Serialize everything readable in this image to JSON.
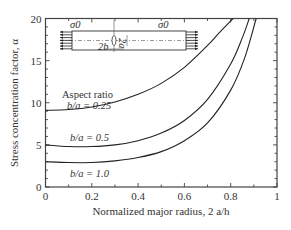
{
  "chart_data": {
    "type": "line",
    "title": "",
    "xlabel": "Normalized major radius, 2 a/h",
    "ylabel": "Stress concentration factor, α",
    "xlim": [
      0,
      1
    ],
    "ylim": [
      0,
      20
    ],
    "xticks": [
      "0",
      "0.2",
      "0.4",
      "0.6",
      "0.8",
      "1"
    ],
    "yticks": [
      "0",
      "5",
      "10",
      "15",
      "20"
    ],
    "grid": false,
    "legend": "inline annotations",
    "series": [
      {
        "name": "b/a = 0.25",
        "label_text": "b/a = 0.25",
        "x": [
          0,
          0.1,
          0.2,
          0.3,
          0.4,
          0.5,
          0.6,
          0.7,
          0.75,
          0.81
        ],
        "y": [
          9.1,
          9.2,
          9.5,
          10.1,
          11.0,
          12.3,
          14.2,
          16.8,
          18.3,
          20.0
        ]
      },
      {
        "name": "b/a = 0.5",
        "label_text": "b/a = 0.5",
        "x": [
          0,
          0.1,
          0.2,
          0.3,
          0.4,
          0.5,
          0.6,
          0.7,
          0.8,
          0.85,
          0.88
        ],
        "y": [
          5.0,
          4.8,
          4.8,
          5.0,
          5.5,
          6.4,
          7.9,
          10.4,
          14.6,
          17.7,
          20.0
        ]
      },
      {
        "name": "b/a = 1.0",
        "label_text": "b/a = 1.0",
        "x": [
          0,
          0.1,
          0.2,
          0.3,
          0.4,
          0.5,
          0.6,
          0.7,
          0.8,
          0.86,
          0.91
        ],
        "y": [
          3.0,
          2.9,
          2.9,
          3.1,
          3.5,
          4.2,
          5.5,
          7.6,
          11.5,
          15.3,
          20.0
        ]
      }
    ],
    "annotations": {
      "aspect_ratio_heading": "Aspect ratio",
      "inset": {
        "left_stress": "σ0",
        "right_stress": "σ0",
        "width_label": "2b",
        "height_label": "2a",
        "description": "Plate under uniaxial tension σ0 with elliptical hole of axes 2a × 2b, plate thickness h"
      }
    }
  }
}
